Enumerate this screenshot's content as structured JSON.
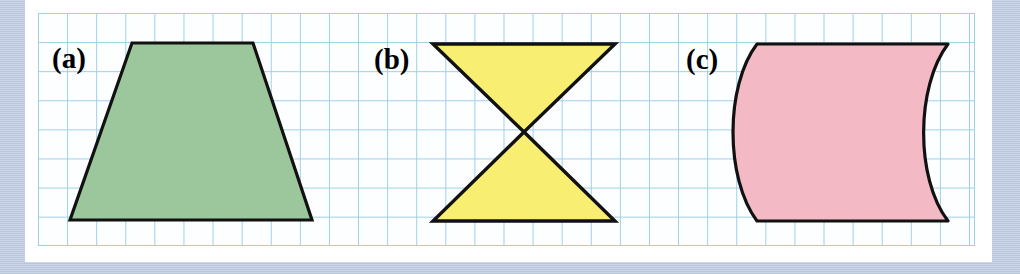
{
  "figure": {
    "caption_labels": [
      "(a)",
      "(b)",
      "(c)"
    ],
    "background_color": "#b9c5dc",
    "panel_color": "#ffffff",
    "grid_line_color": "#9ccfe8",
    "grid_cell_px": 29,
    "outline_color": "#111111"
  },
  "shapes": [
    {
      "label": "(a)",
      "name": "trapezoid",
      "fill_color": "#9cc79c",
      "stroke_color": "#111111",
      "points": "132,43 253,43 312,220 70,220"
    },
    {
      "label": "(b)",
      "name": "bowtie",
      "fill_color": "#f7ee72",
      "stroke_color": "#111111",
      "upper_points": "433,44 615,44 524,132",
      "lower_points": "433,221 615,221 524,132",
      "crossing_point": "524,132"
    },
    {
      "label": "(c)",
      "name": "curved-barrel",
      "fill_color": "#f3bac6",
      "stroke_color": "#111111",
      "path": "M 757,44 L 948,44 C 916,86 915,178 948,221 L 757,221 C 725,178 725,86 757,44 Z"
    }
  ],
  "labels": {
    "a": "(a)",
    "b": "(b)",
    "c": "(c)"
  }
}
